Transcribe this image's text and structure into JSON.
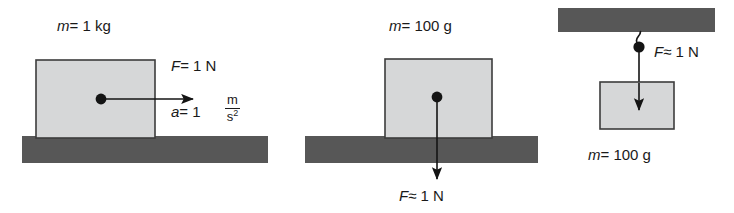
{
  "figure": {
    "colors": {
      "block_fill": "#d6d7d8",
      "block_stroke": "#3c3c3c",
      "ground_fill": "#575757",
      "arrow": "#141414",
      "text": "#1a1a1a",
      "background": "#ffffff"
    }
  },
  "panels": [
    {
      "id": "panel-left",
      "name": "block-pushed-horizontally",
      "mass_label": "m = 1 kg",
      "mass_symbol": "m",
      "mass_value": "= 1 kg",
      "force_label": "F = 1 N",
      "force_symbol": "F",
      "force_value": "= 1 N",
      "accel_symbol": "a",
      "accel_value": "= 1",
      "accel_unit_numerator": "m",
      "accel_unit_denominator": "s",
      "accel_unit_exponent": "2",
      "arrow_direction": "right"
    },
    {
      "id": "panel-middle",
      "name": "block-on-ground-weight",
      "mass_label": "m = 100 g",
      "mass_symbol": "m",
      "mass_value": "= 100 g",
      "force_label": "F ≈ 1 N",
      "force_symbol": "F",
      "force_value": "≈ 1 N",
      "arrow_direction": "down"
    },
    {
      "id": "panel-right",
      "name": "block-hanging-from-ceiling",
      "mass_label": "m = 100 g",
      "mass_symbol": "m",
      "mass_value": "= 100 g",
      "force_label": "F ≈ 1 N",
      "force_symbol": "F",
      "force_value": "≈ 1 N",
      "arrow_direction": "down"
    }
  ]
}
